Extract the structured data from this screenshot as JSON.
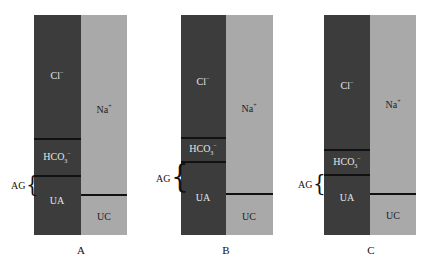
{
  "colors": {
    "anion_column": "#3c3c3c",
    "cation_column": "#a9a9a9",
    "divider": "#111111"
  },
  "panels": [
    {
      "caption": "A",
      "anions": {
        "cl": "Cl",
        "cl_sup": "−",
        "hco3": "HCO",
        "hco3_sub": "3",
        "hco3_sup": "−",
        "ua": "UA"
      },
      "cations": {
        "na": "Na",
        "na_sup": "+",
        "uc": "UC"
      },
      "ag_label": "AG",
      "brace": "{"
    },
    {
      "caption": "B",
      "anions": {
        "cl": "Cl",
        "cl_sup": "−",
        "hco3": "HCO",
        "hco3_sub": "3",
        "hco3_sup": "−",
        "ua": "UA"
      },
      "cations": {
        "na": "Na",
        "na_sup": "+",
        "uc": "UC"
      },
      "ag_label": "AG",
      "brace": "{"
    },
    {
      "caption": "C",
      "anions": {
        "cl": "Cl",
        "cl_sup": "−",
        "hco3": "HCO",
        "hco3_sub": "3",
        "hco3_sup": "−",
        "ua": "UA"
      },
      "cations": {
        "na": "Na",
        "na_sup": "+",
        "uc": "UC"
      },
      "ag_label": "AG",
      "brace": "{"
    }
  ]
}
